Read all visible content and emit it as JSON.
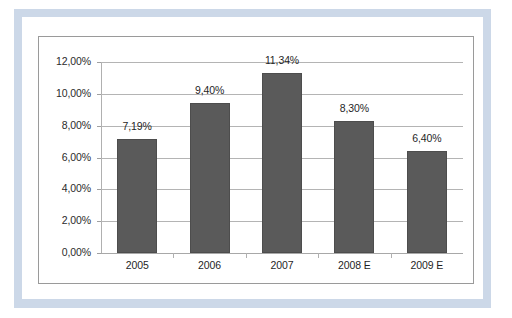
{
  "chart_data": {
    "type": "bar",
    "title": "",
    "subtitle": "",
    "xlabel": "",
    "ylabel": "",
    "categories": [
      "2005",
      "2006",
      "2007",
      "2008 E",
      "2009 E"
    ],
    "values": [
      7.19,
      9.4,
      11.34,
      8.3,
      6.4
    ],
    "value_labels": [
      "7,19%",
      "9,40%",
      "11,34%",
      "8,30%",
      "6,40%"
    ],
    "ylim": [
      0,
      12
    ],
    "ytick_values": [
      0,
      2,
      4,
      6,
      8,
      10,
      12
    ],
    "ytick_labels": [
      "0,00%",
      "2,00%",
      "4,00%",
      "6,00%",
      "8,00%",
      "10,00%",
      "12,00%"
    ],
    "grid": true,
    "legend": false,
    "legend_position": "none",
    "series": [
      {
        "name": "",
        "values": [
          7.19,
          9.4,
          11.34,
          8.3,
          6.4
        ]
      }
    ],
    "colors": {
      "bar_fill": "#5a5a5a",
      "bar_border": "#4d4d4d",
      "gridline": "#b4b4b4",
      "axis": "#b0b0b0",
      "chart_border": "#9a9a9a",
      "outer_band": "#ccd8e8",
      "background": "#ffffff",
      "text": "#1f1f1f"
    }
  }
}
